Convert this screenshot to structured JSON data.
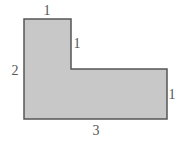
{
  "diagram": {
    "shape": "L-shaped polygon",
    "fill": "#c8c8c8",
    "stroke": "#555555",
    "labels": {
      "top": "1",
      "inner_vertical": "1",
      "left": "2",
      "right": "1",
      "bottom": "3"
    }
  }
}
